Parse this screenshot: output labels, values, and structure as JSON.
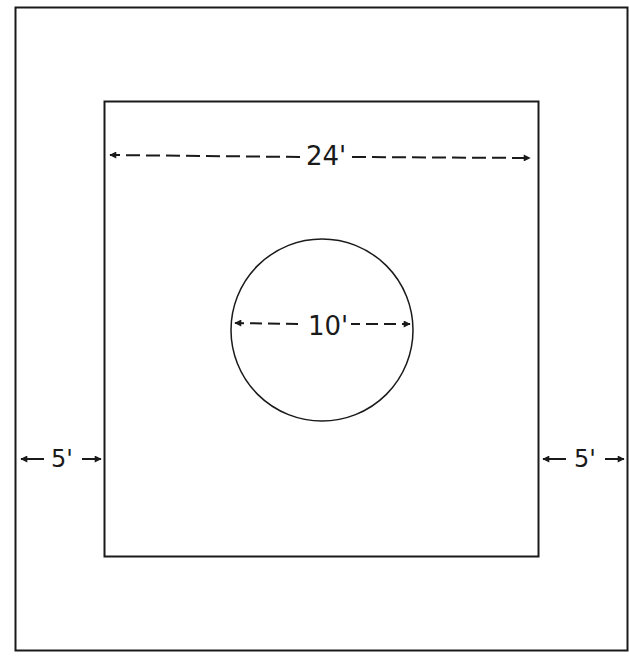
{
  "diagram": {
    "type": "plan-view",
    "stroke_color": "#1a1a1a",
    "background_color": "#ffffff",
    "outer_square": {
      "x": 15,
      "y": 7,
      "width": 613,
      "height": 644
    },
    "inner_square": {
      "x": 104,
      "y": 101,
      "width": 435,
      "height": 456
    },
    "circle": {
      "cx": 322,
      "cy": 330,
      "r": 91
    },
    "dimensions": {
      "inner_width": {
        "label": "24'",
        "value": 24,
        "unit": "ft"
      },
      "circle_diameter": {
        "label": "10'",
        "value": 10,
        "unit": "ft"
      },
      "left_margin": {
        "label": "5'",
        "value": 5,
        "unit": "ft"
      },
      "right_margin": {
        "label": "5'",
        "value": 5,
        "unit": "ft"
      }
    }
  }
}
